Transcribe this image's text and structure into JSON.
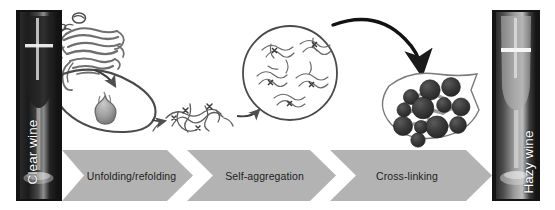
{
  "figure": {
    "background_color": "#ffffff"
  },
  "endpoints": {
    "left": {
      "label": "Clear wine",
      "name": "clear-wine-photo",
      "description": "Photograph of a wine glass containing clear wine"
    },
    "right": {
      "label": "Hazy wine",
      "name": "hazy-wine-photo",
      "description": "Photograph of a wine glass containing cloudy hazy wine"
    }
  },
  "process_band": {
    "band_color": "#b3b3b3",
    "separator_color": "#ffffff",
    "text_color": "#1d1d1d",
    "steps": [
      {
        "label": "Unfolding/refolding"
      },
      {
        "label": "Self-aggregation"
      },
      {
        "label": "Cross-linking"
      }
    ]
  },
  "illustrations": [
    {
      "name": "folded-protein",
      "caption": "Native folded protein ribbon structure"
    },
    {
      "name": "molten-globule",
      "caption": "Partially unfolded molten globule inside lens outline"
    },
    {
      "name": "unfolded-protein",
      "caption": "Unfolded random-coil protein chain"
    },
    {
      "name": "aggregate-circle",
      "caption": "Circle containing several unfolded chains self-aggregating"
    },
    {
      "name": "crosslinked-particles",
      "caption": "Cross-linked dark particles forming haze"
    }
  ],
  "arrows": [
    {
      "name": "arrow-fold-to-globule",
      "style": "curved-thin"
    },
    {
      "name": "arrow-globule-to-unfolded",
      "style": "curved-thin"
    },
    {
      "name": "arrow-unfolded-to-aggregate",
      "style": "curved-thin"
    },
    {
      "name": "arrow-aggregate-to-crosslink",
      "style": "curved-thick"
    }
  ],
  "colors": {
    "band": "#b3b3b3",
    "particle": "#3a3a3a",
    "ink": "#6d6d6d",
    "dark_ink": "#1a1a1a",
    "photo_dark": "#1b1b1b"
  }
}
